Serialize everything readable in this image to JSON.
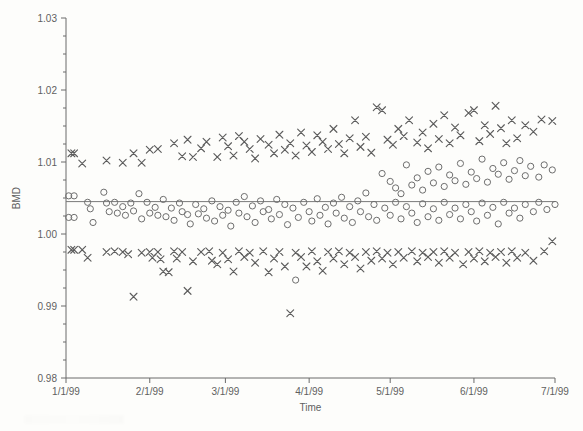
{
  "chart_data": {
    "type": "scatter",
    "title": "",
    "xlabel": "Time",
    "ylabel": "BMD",
    "grid": false,
    "legend": "none",
    "xlim": [
      "1/1/99",
      "7/1/99"
    ],
    "ylim": [
      0.98,
      1.03
    ],
    "ytick_labels": [
      "1.03",
      "1.02",
      "1.01",
      "1.00",
      "0.99",
      "0.98"
    ],
    "ytick_values": [
      1.03,
      1.02,
      1.01,
      1.0,
      0.99,
      0.98
    ],
    "yminor_step": 0.0025,
    "xtick_labels": [
      "1/1/99",
      "2/1/99",
      "3/1/99",
      "4/1/99",
      "5/1/99",
      "6/1/99",
      "7/1/99"
    ],
    "xtick_days": [
      0,
      31,
      59,
      90,
      120,
      151,
      181
    ],
    "reference_line": {
      "label": "horizontal reference line",
      "y": 1.0045,
      "x_start_day": 0,
      "x_end_day": 181
    },
    "series": [
      {
        "name": "x-series",
        "marker": "x",
        "color": "#5d5d5d",
        "points": [
          [
            2,
            1.0112
          ],
          [
            3,
            1.0112
          ],
          [
            2,
            0.9978
          ],
          [
            3,
            0.9978
          ],
          [
            6,
            1.0098
          ],
          [
            6,
            0.9978
          ],
          [
            8,
            0.9967
          ],
          [
            15,
            1.0102
          ],
          [
            15,
            0.9975
          ],
          [
            18,
            0.9976
          ],
          [
            21,
            1.0099
          ],
          [
            21,
            0.9975
          ],
          [
            23,
            0.9972
          ],
          [
            25,
            1.0112
          ],
          [
            25,
            0.9913
          ],
          [
            28,
            1.0099
          ],
          [
            28,
            0.9974
          ],
          [
            31,
            1.0117
          ],
          [
            31,
            0.9975
          ],
          [
            32,
            0.9967
          ],
          [
            34,
            1.0118
          ],
          [
            34,
            0.9975
          ],
          [
            35,
            0.9965
          ],
          [
            36,
            0.9948
          ],
          [
            38,
            0.9947
          ],
          [
            40,
            1.0126
          ],
          [
            40,
            0.9976
          ],
          [
            41,
            0.9966
          ],
          [
            43,
            1.0108
          ],
          [
            43,
            0.9975
          ],
          [
            45,
            1.0131
          ],
          [
            45,
            0.9921
          ],
          [
            47,
            1.0107
          ],
          [
            47,
            0.9962
          ],
          [
            50,
            1.0119
          ],
          [
            50,
            0.9975
          ],
          [
            52,
            1.0128
          ],
          [
            53,
            0.9976
          ],
          [
            54,
            0.9963
          ],
          [
            56,
            1.0107
          ],
          [
            56,
            0.9958
          ],
          [
            58,
            1.0134
          ],
          [
            58,
            0.9974
          ],
          [
            60,
            1.0122
          ],
          [
            60,
            0.9965
          ],
          [
            62,
            1.0109
          ],
          [
            62,
            0.9948
          ],
          [
            64,
            1.0136
          ],
          [
            64,
            0.9976
          ],
          [
            66,
            1.0128
          ],
          [
            66,
            0.9968
          ],
          [
            68,
            1.0118
          ],
          [
            68,
            0.9974
          ],
          [
            70,
            1.0105
          ],
          [
            70,
            0.996
          ],
          [
            72,
            1.0132
          ],
          [
            73,
            0.9976
          ],
          [
            75,
            1.0124
          ],
          [
            75,
            0.9947
          ],
          [
            77,
            1.0112
          ],
          [
            77,
            0.9966
          ],
          [
            79,
            1.0138
          ],
          [
            79,
            0.9975
          ],
          [
            81,
            1.0117
          ],
          [
            81,
            0.9955
          ],
          [
            83,
            1.0126
          ],
          [
            83,
            0.989
          ],
          [
            85,
            1.0109
          ],
          [
            85,
            0.9974
          ],
          [
            87,
            1.0141
          ],
          [
            87,
            0.9968
          ],
          [
            89,
            1.0123
          ],
          [
            89,
            0.9955
          ],
          [
            91,
            1.0114
          ],
          [
            91,
            0.9976
          ],
          [
            93,
            1.0137
          ],
          [
            93,
            0.9962
          ],
          [
            95,
            1.0128
          ],
          [
            95,
            0.9949
          ],
          [
            97,
            1.0118
          ],
          [
            97,
            0.9975
          ],
          [
            99,
            1.0146
          ],
          [
            99,
            0.9966
          ],
          [
            101,
            1.0125
          ],
          [
            101,
            0.9976
          ],
          [
            103,
            1.0112
          ],
          [
            103,
            0.9958
          ],
          [
            105,
            1.0133
          ],
          [
            105,
            0.9974
          ],
          [
            107,
            1.0158
          ],
          [
            107,
            0.9968
          ],
          [
            109,
            1.0121
          ],
          [
            109,
            0.9952
          ],
          [
            111,
            1.0135
          ],
          [
            111,
            0.9975
          ],
          [
            113,
            1.0113
          ],
          [
            113,
            0.9963
          ],
          [
            115,
            1.0176
          ],
          [
            115,
            0.9976
          ],
          [
            117,
            1.0172
          ],
          [
            117,
            0.9966
          ],
          [
            119,
            1.0131
          ],
          [
            119,
            0.9974
          ],
          [
            121,
            1.0124
          ],
          [
            121,
            0.9958
          ],
          [
            123,
            1.0146
          ],
          [
            123,
            0.9975
          ],
          [
            125,
            1.0136
          ],
          [
            125,
            0.9967
          ],
          [
            127,
            1.0158
          ],
          [
            128,
            0.9976
          ],
          [
            130,
            1.0127
          ],
          [
            130,
            0.9962
          ],
          [
            132,
            1.0141
          ],
          [
            132,
            0.9974
          ],
          [
            134,
            1.0119
          ],
          [
            134,
            0.9968
          ],
          [
            136,
            1.0153
          ],
          [
            136,
            0.9975
          ],
          [
            138,
            1.0132
          ],
          [
            138,
            0.996
          ],
          [
            140,
            1.0165
          ],
          [
            140,
            0.9976
          ],
          [
            142,
            1.0126
          ],
          [
            142,
            0.9967
          ],
          [
            144,
            1.0148
          ],
          [
            144,
            0.9974
          ],
          [
            146,
            1.0137
          ],
          [
            147,
            0.9958
          ],
          [
            149,
            1.0168
          ],
          [
            149,
            0.9975
          ],
          [
            151,
            1.0172
          ],
          [
            151,
            0.9966
          ],
          [
            153,
            1.0129
          ],
          [
            153,
            0.9976
          ],
          [
            155,
            1.0151
          ],
          [
            155,
            0.9962
          ],
          [
            157,
            1.0139
          ],
          [
            157,
            0.9974
          ],
          [
            159,
            1.0178
          ],
          [
            159,
            0.9968
          ],
          [
            161,
            1.0147
          ],
          [
            161,
            0.9975
          ],
          [
            163,
            1.0126
          ],
          [
            163,
            0.996
          ],
          [
            165,
            1.0158
          ],
          [
            165,
            0.9976
          ],
          [
            167,
            1.0133
          ],
          [
            167,
            0.9967
          ],
          [
            170,
            1.0151
          ],
          [
            170,
            0.9974
          ],
          [
            173,
            1.0142
          ],
          [
            173,
            0.9963
          ],
          [
            176,
            1.0159
          ],
          [
            177,
            0.9976
          ],
          [
            180,
            1.0157
          ],
          [
            180,
            0.999
          ]
        ]
      },
      {
        "name": "o-series",
        "marker": "o",
        "color": "#6e6e6e",
        "points": [
          [
            1,
            1.0053
          ],
          [
            3,
            1.0053
          ],
          [
            1,
            1.0023
          ],
          [
            3,
            1.0023
          ],
          [
            8,
            1.0044
          ],
          [
            9,
            1.0035
          ],
          [
            10,
            1.0016
          ],
          [
            14,
            1.0058
          ],
          [
            15,
            1.0043
          ],
          [
            16,
            1.0031
          ],
          [
            18,
            1.0044
          ],
          [
            19,
            1.0029
          ],
          [
            21,
            1.0038
          ],
          [
            22,
            1.0026
          ],
          [
            24,
            1.0043
          ],
          [
            25,
            1.0032
          ],
          [
            27,
            1.0056
          ],
          [
            28,
            1.0021
          ],
          [
            30,
            1.0044
          ],
          [
            31,
            1.0029
          ],
          [
            33,
            1.0037
          ],
          [
            34,
            1.0026
          ],
          [
            36,
            1.0048
          ],
          [
            37,
            1.0024
          ],
          [
            39,
            1.0036
          ],
          [
            40,
            1.0019
          ],
          [
            42,
            1.0043
          ],
          [
            43,
            1.0031
          ],
          [
            45,
            1.0027
          ],
          [
            46,
            1.0014
          ],
          [
            48,
            1.0041
          ],
          [
            49,
            1.0028
          ],
          [
            51,
            1.0035
          ],
          [
            52,
            1.0022
          ],
          [
            54,
            1.0046
          ],
          [
            55,
            1.0018
          ],
          [
            57,
            1.0038
          ],
          [
            58,
            1.0026
          ],
          [
            60,
            1.0033
          ],
          [
            61,
            1.0011
          ],
          [
            63,
            1.0044
          ],
          [
            64,
            1.0029
          ],
          [
            66,
            1.0052
          ],
          [
            67,
            1.0024
          ],
          [
            69,
            1.0039
          ],
          [
            70,
            1.0016
          ],
          [
            72,
            1.0046
          ],
          [
            73,
            1.0031
          ],
          [
            75,
            1.0034
          ],
          [
            76,
            1.0021
          ],
          [
            78,
            1.0048
          ],
          [
            79,
            1.0027
          ],
          [
            81,
            1.0041
          ],
          [
            82,
            1.0013
          ],
          [
            84,
            1.0036
          ],
          [
            85,
            0.9936
          ],
          [
            86,
            1.0023
          ],
          [
            88,
            1.0044
          ],
          [
            90,
            1.0031
          ],
          [
            91,
            1.0018
          ],
          [
            93,
            1.0049
          ],
          [
            94,
            1.0026
          ],
          [
            96,
            1.0037
          ],
          [
            97,
            1.0014
          ],
          [
            99,
            1.0043
          ],
          [
            100,
            1.0029
          ],
          [
            102,
            1.0051
          ],
          [
            103,
            1.0022
          ],
          [
            105,
            1.0038
          ],
          [
            106,
            1.0016
          ],
          [
            108,
            1.0046
          ],
          [
            109,
            1.0031
          ],
          [
            111,
            1.0057
          ],
          [
            112,
            1.0024
          ],
          [
            114,
            1.0041
          ],
          [
            115,
            1.0019
          ],
          [
            117,
            1.0084
          ],
          [
            118,
            1.0036
          ],
          [
            120,
            1.0073
          ],
          [
            120,
            1.0026
          ],
          [
            122,
            1.0064
          ],
          [
            122,
            1.0044
          ],
          [
            124,
            1.0056
          ],
          [
            124,
            1.0021
          ],
          [
            126,
            1.0096
          ],
          [
            126,
            1.0038
          ],
          [
            128,
            1.0068
          ],
          [
            128,
            1.0029
          ],
          [
            130,
            1.0078
          ],
          [
            130,
            1.0016
          ],
          [
            132,
            1.0061
          ],
          [
            132,
            1.0042
          ],
          [
            134,
            1.0087
          ],
          [
            134,
            1.0024
          ],
          [
            136,
            1.0071
          ],
          [
            136,
            1.0035
          ],
          [
            138,
            1.0093
          ],
          [
            138,
            1.0019
          ],
          [
            140,
            1.0066
          ],
          [
            140,
            1.0044
          ],
          [
            142,
            1.0082
          ],
          [
            142,
            1.0027
          ],
          [
            144,
            1.0074
          ],
          [
            144,
            1.0036
          ],
          [
            146,
            1.0098
          ],
          [
            146,
            1.0021
          ],
          [
            148,
            1.0069
          ],
          [
            148,
            1.0041
          ],
          [
            150,
            1.0086
          ],
          [
            150,
            1.0031
          ],
          [
            152,
            1.0077
          ],
          [
            152,
            1.0018
          ],
          [
            154,
            1.0104
          ],
          [
            154,
            1.0043
          ],
          [
            156,
            1.0072
          ],
          [
            156,
            1.0026
          ],
          [
            158,
            1.0091
          ],
          [
            158,
            1.0037
          ],
          [
            160,
            1.0083
          ],
          [
            160,
            1.0014
          ],
          [
            162,
            1.0099
          ],
          [
            162,
            1.0044
          ],
          [
            164,
            1.0076
          ],
          [
            164,
            1.0029
          ],
          [
            166,
            1.0088
          ],
          [
            166,
            1.0036
          ],
          [
            168,
            1.0102
          ],
          [
            168,
            1.0022
          ],
          [
            170,
            1.0081
          ],
          [
            170,
            1.0041
          ],
          [
            172,
            1.0094
          ],
          [
            173,
            1.0031
          ],
          [
            175,
            1.0079
          ],
          [
            175,
            1.0044
          ],
          [
            177,
            1.0096
          ],
          [
            178,
            1.0034
          ],
          [
            180,
            1.0089
          ],
          [
            181,
            1.0041
          ]
        ]
      }
    ]
  }
}
